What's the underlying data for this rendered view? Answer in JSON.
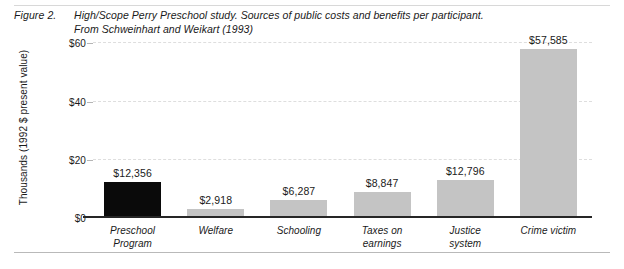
{
  "figure": {
    "number": "Figure 2.",
    "caption_line1": "High/Scope Perry Preschool study. Sources of public costs and benefits per participant.",
    "caption_line2": "From Schweinhart and Weikart (1993)"
  },
  "chart_data": {
    "type": "bar",
    "title": "High/Scope Perry Preschool study. Sources of public costs and benefits per participant.",
    "xlabel": "",
    "ylabel": "Thousands (1992 $ present value)",
    "ylim": [
      0,
      60
    ],
    "yticks": [
      0,
      20,
      40,
      60
    ],
    "ytick_labels": [
      "$0",
      "$20",
      "$40",
      "$60"
    ],
    "grid": true,
    "legend": "none",
    "categories": [
      "Preschool Program",
      "Welfare",
      "Schooling",
      "Taxes on earnings",
      "Justice system",
      "Crime victim"
    ],
    "category_lines": [
      [
        "Preschool",
        "Program"
      ],
      [
        "Welfare",
        ""
      ],
      [
        "Schooling",
        ""
      ],
      [
        "Taxes on",
        "earnings"
      ],
      [
        "Justice",
        "system"
      ],
      [
        "Crime victim",
        ""
      ]
    ],
    "values": [
      12356,
      2918,
      6287,
      8847,
      12796,
      57585
    ],
    "value_labels": [
      "$12,356",
      "$2,918",
      "$6,287",
      "$8,847",
      "$12,796",
      "$57,585"
    ],
    "bar_colors": [
      "#0a0a0a",
      "#c4c4c4",
      "#c4c4c4",
      "#c4c4c4",
      "#c4c4c4",
      "#c4c4c4"
    ]
  },
  "colors": {
    "bar_dark": "#0a0a0a",
    "bar_light": "#c4c4c4",
    "axis": "#262626",
    "gridline": "#dedede",
    "text": "#1a1a1a",
    "background": "#ffffff"
  }
}
